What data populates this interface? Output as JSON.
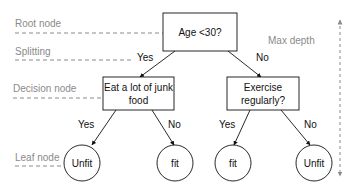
{
  "colors": {
    "node_stroke": "#111111",
    "guide_gray": "#8a8a8a",
    "background": "#ffffff"
  },
  "annotations": {
    "root_node": "Root node",
    "splitting": "Splitting",
    "decision_node": "Decision node",
    "leaf_node": "Leaf node",
    "max_depth": "Max depth"
  },
  "tree": {
    "root": {
      "label": "Age <30?"
    },
    "edges": {
      "root_left": "Yes",
      "root_right": "No",
      "left_left": "Yes",
      "left_right": "No",
      "right_left": "Yes",
      "right_right": "No"
    },
    "decision_left": {
      "line1": "Eat a lot of junk",
      "line2": "food"
    },
    "decision_right": {
      "line1": "Exercise",
      "line2": "regularly?"
    },
    "leaves": [
      {
        "label": "Unfit"
      },
      {
        "label": "fit"
      },
      {
        "label": "fit"
      },
      {
        "label": "Unfit"
      }
    ]
  }
}
